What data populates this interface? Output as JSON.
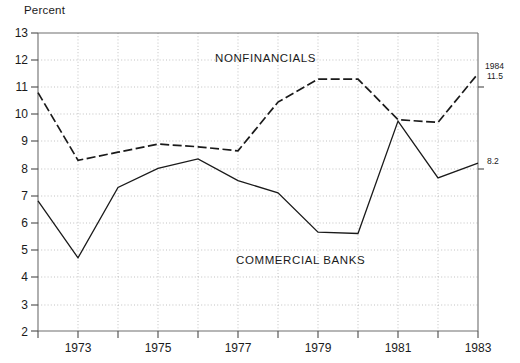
{
  "chart_data": {
    "type": "line",
    "title": "",
    "ylabel": "Percent",
    "xlabel": "",
    "ylim": [
      2,
      13
    ],
    "xlim": [
      1973,
      1984
    ],
    "grid": true,
    "legend_position": "inline-annotations",
    "yticks": [
      "13",
      "12",
      "11",
      "10",
      "9",
      "8",
      "7",
      "6",
      "5",
      "4",
      "3",
      "2"
    ],
    "ytick_values": [
      13,
      12,
      11,
      10,
      9,
      8,
      7,
      6,
      5,
      4,
      3,
      2
    ],
    "xticks": [
      "1973",
      "1975",
      "1977",
      "1979",
      "1981",
      "1983"
    ],
    "xtick_values": [
      1973,
      1975,
      1977,
      1979,
      1981,
      1983
    ],
    "x": [
      1973,
      1974,
      1975,
      1976,
      1977,
      1978,
      1979,
      1980,
      1981,
      1982,
      1983,
      1984
    ],
    "series": [
      {
        "name": "NONFINANCIALS",
        "style": "dashed",
        "color": "#1a1a1a",
        "values": [
          10.8,
          8.3,
          8.6,
          8.9,
          8.8,
          8.65,
          10.45,
          11.3,
          11.3,
          9.8,
          9.7,
          11.5
        ]
      },
      {
        "name": "COMMERCIAL BANKS",
        "style": "solid",
        "color": "#1a1a1a",
        "values": [
          6.8,
          4.7,
          7.3,
          8.0,
          8.35,
          7.55,
          7.1,
          5.65,
          5.6,
          9.75,
          7.65,
          8.2
        ]
      }
    ],
    "annotations": [
      {
        "name": "nonfinancials-label",
        "text": "NONFINANCIALS",
        "x_px": 215,
        "y_px": 52
      },
      {
        "name": "commercial-banks-label",
        "text": "COMMERCIAL BANKS",
        "x_px": 236,
        "y_px": 254
      },
      {
        "name": "endpoint-year",
        "text": "1984",
        "x_px": 485,
        "y_px": 62
      },
      {
        "name": "endpoint-nonfinancials-value",
        "text": "11.5",
        "x_px": 487,
        "y_px": 72
      },
      {
        "name": "endpoint-commercial-banks-value",
        "text": "8.2",
        "x_px": 487,
        "y_px": 157
      }
    ]
  }
}
